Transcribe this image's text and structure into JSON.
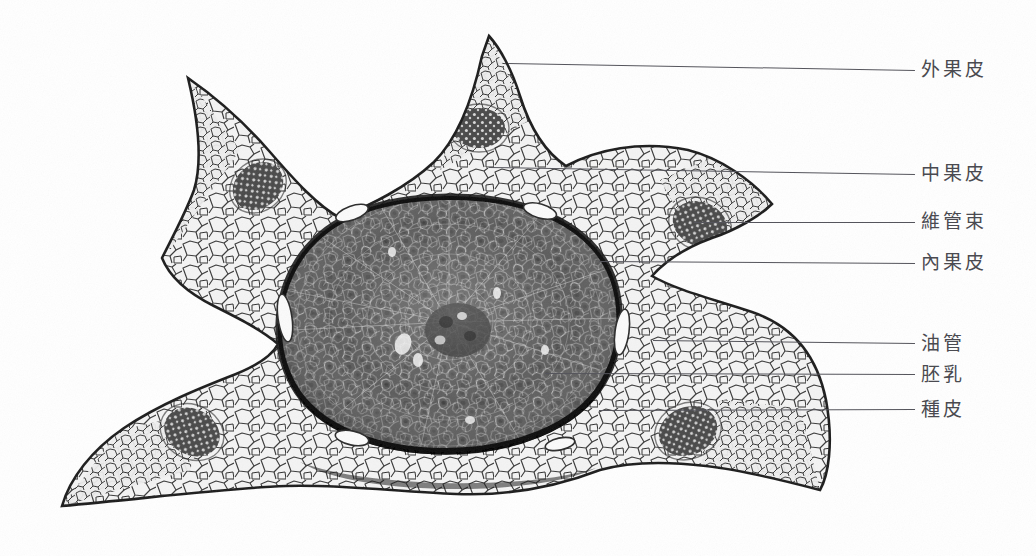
{
  "figure": {
    "kind": "botanical-micrograph",
    "background_color": "#ffffff",
    "line_color": "#55555c",
    "text_color": "#4a4a50"
  },
  "annotations": [
    {
      "id": "exocarp",
      "label": "外果皮",
      "line": {
        "x1": 508,
        "y1": 63,
        "x2": 915,
        "y2": 70
      },
      "text": {
        "x": 921,
        "y": 58
      }
    },
    {
      "id": "mesocarp",
      "label": "中果皮",
      "line": {
        "x1": 489,
        "y1": 167,
        "x2": 915,
        "y2": 174
      },
      "text": {
        "x": 921,
        "y": 162
      }
    },
    {
      "id": "vascular-bundle",
      "label": "維管束",
      "line": {
        "x1": 694,
        "y1": 222,
        "x2": 915,
        "y2": 222
      },
      "text": {
        "x": 921,
        "y": 210
      }
    },
    {
      "id": "endocarp",
      "label": "內果皮",
      "line": {
        "x1": 599,
        "y1": 261,
        "x2": 915,
        "y2": 263
      },
      "text": {
        "x": 921,
        "y": 251
      }
    },
    {
      "id": "oil-tube",
      "label": "油管",
      "line": {
        "x1": 653,
        "y1": 340,
        "x2": 915,
        "y2": 343
      },
      "text": {
        "x": 921,
        "y": 332
      }
    },
    {
      "id": "endosperm",
      "label": "胚乳",
      "line": {
        "x1": 545,
        "y1": 373,
        "x2": 915,
        "y2": 374
      },
      "text": {
        "x": 921,
        "y": 363
      }
    },
    {
      "id": "seed-coat",
      "label": "種皮",
      "line": {
        "x1": 599,
        "y1": 410,
        "x2": 915,
        "y2": 409
      },
      "text": {
        "x": 921,
        "y": 398
      }
    }
  ]
}
